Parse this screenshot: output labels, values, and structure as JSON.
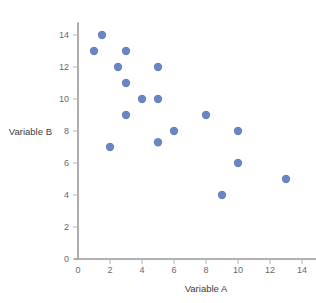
{
  "chart_data": {
    "type": "scatter",
    "title": "",
    "xlabel": "Variable A",
    "ylabel": "Variable B",
    "xlim": [
      0,
      15
    ],
    "ylim": [
      0,
      14.8
    ],
    "xticks": [
      0,
      2,
      4,
      6,
      8,
      10,
      12,
      14
    ],
    "yticks": [
      0,
      2,
      4,
      6,
      8,
      10,
      12,
      14
    ],
    "xtick_labels": [
      "0",
      "2",
      "4",
      "6",
      "8",
      "10",
      "12",
      "14"
    ],
    "ytick_labels": [
      "0",
      "2",
      "4",
      "6",
      "8",
      "10",
      "12",
      "14"
    ],
    "grid": false,
    "legend": null,
    "marker_color": "#6a86c3",
    "marker_size": 4.2,
    "series": [
      {
        "name": "observations",
        "points": [
          [
            1.5,
            14
          ],
          [
            1,
            13
          ],
          [
            3,
            13
          ],
          [
            2.5,
            12
          ],
          [
            5,
            12
          ],
          [
            3,
            11
          ],
          [
            4,
            10
          ],
          [
            5,
            10
          ],
          [
            3,
            9
          ],
          [
            8,
            9
          ],
          [
            6,
            8
          ],
          [
            10,
            8
          ],
          [
            5,
            7.3
          ],
          [
            2,
            7
          ],
          [
            10,
            6
          ],
          [
            13,
            5
          ],
          [
            9,
            4
          ]
        ]
      }
    ]
  },
  "labels": {
    "x_axis_title": "Variable A",
    "y_axis_title": "Variable B"
  },
  "colors": {
    "marker": "#6a86c3",
    "axis": "#9a9a9a",
    "tick": "#b5b5b5",
    "tick_text": "#6a6a6a",
    "title_text": "#3b3b3b",
    "background": "#ffffff"
  }
}
